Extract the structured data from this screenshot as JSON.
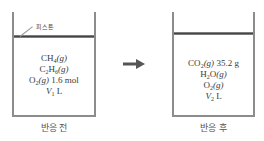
{
  "diagram": {
    "piston_label": "피스톤",
    "before": {
      "label": "반응 전",
      "lines": [
        {
          "species": "CH",
          "sub": "4",
          "state": "(g)",
          "amount": ""
        },
        {
          "species": "C",
          "sub": "2",
          "species2": "H",
          "sub2": "6",
          "state": "(g)",
          "amount": ""
        },
        {
          "species": "O",
          "sub": "2",
          "state": "(g)",
          "amount": "1.6 mol"
        },
        {
          "volume_symbol": "V",
          "volume_sub": "1",
          "unit": "L"
        }
      ]
    },
    "after": {
      "label": "반응 후",
      "lines": [
        {
          "species": "CO",
          "sub": "2",
          "state": "(g)",
          "amount": "35.2 g"
        },
        {
          "species": "H",
          "sub": "2",
          "species2": "O",
          "state": "(g)",
          "amount": ""
        },
        {
          "species": "O",
          "sub": "2",
          "state": "(g)",
          "amount": ""
        },
        {
          "volume_symbol": "V",
          "volume_sub": "2",
          "unit": "L"
        }
      ]
    },
    "arrow": "right-arrow",
    "colors": {
      "wall": "#8c8c8c",
      "piston": "#444444",
      "text": "#3a3a3a"
    }
  }
}
